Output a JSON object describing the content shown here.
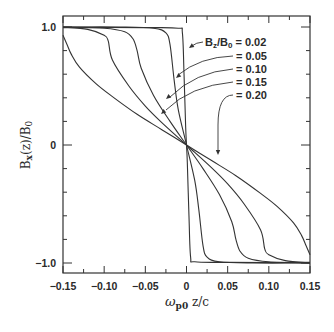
{
  "chart_data": {
    "type": "line",
    "title": "",
    "xlabel": "ω_p0 z/c",
    "ylabel": "B_x(z)/B_0",
    "xlim": [
      -0.15,
      0.15
    ],
    "ylim": [
      -1.08,
      1.08
    ],
    "x_ticks": [
      -0.15,
      -0.1,
      -0.05,
      0,
      0.05,
      0.1,
      0.15
    ],
    "x_tick_labels": [
      "-0.15",
      "-0.10",
      "-0.05",
      "0",
      "0.05",
      "0.10",
      "0.15"
    ],
    "y_ticks": [
      -1.0,
      0,
      1.0
    ],
    "y_tick_labels": [
      "-1.0",
      "0",
      "1.0"
    ],
    "grid": false,
    "legend_position": "upper right (annotated with leader arrows)",
    "legend_prefix": "B_z/B_0",
    "series": [
      {
        "name": "B_z/B_0 = 0.02",
        "label": "0.02",
        "x": [
          -0.15,
          -0.05,
          -0.01,
          -0.005,
          -0.003,
          -0.001,
          0,
          0.001,
          0.003,
          0.005,
          0.01,
          0.05,
          0.15
        ],
        "y": [
          0.995,
          0.995,
          0.99,
          0.95,
          0.6,
          0.15,
          0,
          -0.15,
          -0.6,
          -0.95,
          -0.99,
          -0.995,
          -0.995
        ]
      },
      {
        "name": "B_z/B_0 = 0.05",
        "label": "0.05",
        "x": [
          -0.15,
          -0.08,
          -0.04,
          -0.025,
          -0.02,
          -0.015,
          -0.01,
          0,
          0.01,
          0.015,
          0.02,
          0.025,
          0.04,
          0.08,
          0.15
        ],
        "y": [
          1.0,
          1.0,
          0.99,
          0.95,
          0.85,
          0.55,
          0.3,
          0,
          -0.3,
          -0.55,
          -0.85,
          -0.95,
          -0.99,
          -1.0,
          -1.0
        ]
      },
      {
        "name": "B_z/B_0 = 0.10",
        "label": "0.10",
        "x": [
          -0.15,
          -0.1,
          -0.075,
          -0.065,
          -0.06,
          -0.055,
          -0.04,
          -0.02,
          0,
          0.02,
          0.04,
          0.055,
          0.06,
          0.065,
          0.075,
          0.1,
          0.15
        ],
        "y": [
          1.0,
          0.99,
          0.96,
          0.9,
          0.8,
          0.65,
          0.42,
          0.2,
          0,
          -0.2,
          -0.42,
          -0.65,
          -0.8,
          -0.9,
          -0.96,
          -0.99,
          -1.0
        ]
      },
      {
        "name": "B_z/B_0 = 0.15",
        "label": "0.15",
        "x": [
          -0.15,
          -0.12,
          -0.1,
          -0.095,
          -0.09,
          -0.07,
          -0.05,
          -0.03,
          0,
          0.03,
          0.05,
          0.07,
          0.09,
          0.095,
          0.1,
          0.12,
          0.15
        ],
        "y": [
          1.0,
          0.98,
          0.93,
          0.88,
          0.72,
          0.5,
          0.33,
          0.19,
          0,
          -0.19,
          -0.33,
          -0.5,
          -0.72,
          -0.88,
          -0.93,
          -0.98,
          -1.0
        ]
      },
      {
        "name": "B_z/B_0 = 0.20",
        "label": "0.20",
        "x": [
          -0.15,
          -0.145,
          -0.14,
          -0.13,
          -0.11,
          -0.09,
          -0.06,
          -0.03,
          0,
          0.03,
          0.06,
          0.09,
          0.11,
          0.13,
          0.14,
          0.145,
          0.15
        ],
        "y": [
          0.93,
          0.85,
          0.77,
          0.66,
          0.52,
          0.41,
          0.26,
          0.13,
          0,
          -0.13,
          -0.26,
          -0.41,
          -0.52,
          -0.66,
          -0.77,
          -0.85,
          -0.93
        ]
      }
    ]
  },
  "labels": {
    "xlabel_main": "ω",
    "xlabel_sub": "p0",
    "xlabel_rest": " z/c",
    "ylabel_main": "B",
    "ylabel_sub": "x",
    "ylabel_rest": "(z)/B",
    "ylabel_sub2": "0",
    "legend_lines": [
      {
        "prefix": "B",
        "sub": "z",
        "mid": "/B",
        "sub2": "0",
        "value": "= 0.02"
      },
      {
        "value": "= 0.05"
      },
      {
        "value": "= 0.10"
      },
      {
        "value": "= 0.15"
      },
      {
        "value": "= 0.20"
      }
    ]
  },
  "colors": {
    "line": "#333333",
    "text": "#2a2a2a",
    "background": "#ffffff"
  }
}
